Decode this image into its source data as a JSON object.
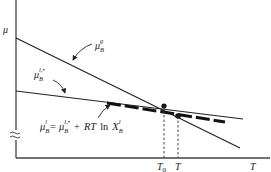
{
  "diagram": {
    "y_axis_label": "μ",
    "x_axis_label": "T",
    "curves": [
      {
        "id": "mu_B_g",
        "label_base": "μ",
        "label_sub": "B",
        "label_sup": "g",
        "style": "solid"
      },
      {
        "id": "mu_B_l_star",
        "label_base": "μ",
        "label_sub": "B",
        "label_sup": "l,•",
        "style": "solid"
      },
      {
        "id": "mu_B_l",
        "style": "dashed-thick"
      }
    ],
    "equation": {
      "lhs_base": "μ",
      "lhs_sub": "B",
      "lhs_sup": "l",
      "equals": "=",
      "rhs1_base": "μ",
      "rhs1_sub": "B",
      "rhs1_sup": "l,•",
      "plus": "+",
      "rt": "RT",
      "ln": "ln",
      "x_base": "X",
      "x_sub": "B",
      "x_sup": "l"
    },
    "x_ticks": [
      {
        "label_base": "T",
        "label_sub": "0"
      },
      {
        "label_base": "T",
        "label_sub": ""
      }
    ],
    "axis_break_symbol": "≈",
    "colors": {
      "line": "#222222",
      "axis": "#444444",
      "background": "#ffffff"
    }
  }
}
